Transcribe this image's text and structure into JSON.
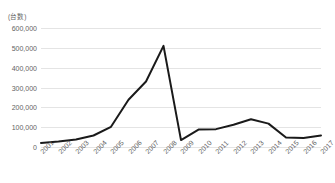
{
  "chart_data": {
    "type": "line",
    "title": "",
    "subtitle": "",
    "xlabel": "",
    "ylabel": "(台数)",
    "categories": [
      "2001",
      "2002",
      "2003",
      "2004",
      "2005",
      "2006",
      "2007",
      "2008",
      "2009",
      "2010",
      "2011",
      "2012",
      "2013",
      "2014",
      "2015",
      "2016",
      "2017"
    ],
    "series": [
      {
        "name": "台数",
        "values": [
          20000,
          28000,
          38000,
          58000,
          102000,
          238000,
          330000,
          510000,
          35000,
          88000,
          90000,
          112000,
          140000,
          118000,
          48000,
          45000,
          58000
        ]
      }
    ],
    "ylim": [
      0,
      600000
    ],
    "ytick_values": [
      600000,
      500000,
      400000,
      300000,
      200000,
      100000,
      0
    ],
    "ytick_labels": [
      "600,000",
      "500,000",
      "400,000",
      "300,000",
      "200,000",
      "100,000",
      "0"
    ],
    "grid": true,
    "grid_axis": "y",
    "legend": false,
    "legend_position": "none",
    "line_color": "#1a1a1a",
    "gridline_color": "#e4e4e4",
    "tick_label_color": "#636363",
    "axis_title_color": "#666666",
    "background_color": "#ffffff",
    "xtick_rotation_deg": -45
  }
}
